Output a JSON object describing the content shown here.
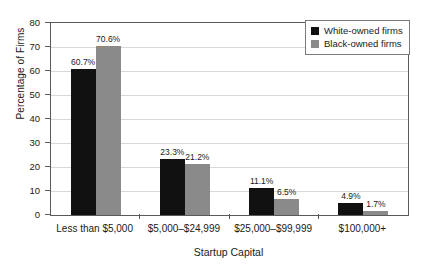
{
  "chart_data": {
    "type": "bar",
    "title": "",
    "xlabel": "Startup Capital",
    "ylabel": "Percentage of Firms",
    "categories": [
      "Less than $5,000",
      "$5,000–$24,999",
      "$25,000–$99,999",
      "$100,000+"
    ],
    "series": [
      {
        "name": "White-owned firms",
        "color": "#111111",
        "values": [
          60.7,
          23.3,
          11.1,
          4.9
        ],
        "labels": [
          "60.7%",
          "23.3%",
          "11.1%",
          "4.9%"
        ]
      },
      {
        "name": "Black-owned firms",
        "color": "#8a8a8a",
        "values": [
          70.6,
          21.2,
          6.5,
          1.7
        ],
        "labels": [
          "70.6%",
          "21.2%",
          "6.5%",
          "1.7%"
        ]
      }
    ],
    "ylim": [
      0,
      80
    ],
    "yticks": [
      0,
      10,
      20,
      30,
      40,
      50,
      60,
      70,
      80
    ],
    "ytick_labels": [
      "0",
      "10",
      "20",
      "30",
      "40",
      "50",
      "60",
      "70",
      "80"
    ],
    "grid": true,
    "legend_position": "top-right"
  }
}
